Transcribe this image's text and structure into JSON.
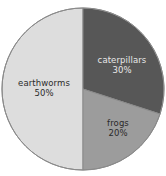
{
  "chart_data": {
    "type": "pie",
    "title": "",
    "subtitle": "",
    "xlabel": "",
    "ylabel": "",
    "grid": false,
    "legend_position": "none",
    "labels_inside_slices": true,
    "total_percent": "100%",
    "categories": [
      "earthworms",
      "caterpillars",
      "frogs"
    ],
    "values": [
      50,
      30,
      20
    ],
    "slices": [
      {
        "label": "earthworms",
        "value": 50,
        "value_label": "50%",
        "color": "#dddddd",
        "start_angle_deg": 180,
        "end_angle_deg": 360,
        "text_color": "#2b2b2b"
      },
      {
        "label": "caterpillars",
        "value": 30,
        "value_label": "30%",
        "color": "#575757",
        "start_angle_deg": 0,
        "end_angle_deg": 108,
        "text_color": "#e8e8e8"
      },
      {
        "label": "frogs",
        "value": 20,
        "value_label": "20%",
        "color": "#9c9c9c",
        "start_angle_deg": 108,
        "end_angle_deg": 180,
        "text_color": "#2a2a2a"
      }
    ],
    "colors": {
      "earthworms": "#dddddd",
      "caterpillars": "#575757",
      "frogs": "#9c9c9c",
      "outline": "#8a8a8a",
      "background": "#ffffff"
    }
  }
}
